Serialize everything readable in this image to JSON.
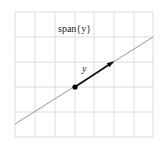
{
  "diagram": {
    "span_label": "span{y}",
    "vector_label": "y",
    "grid": {
      "x_lines": [
        15,
        35,
        55,
        75,
        94,
        114,
        134,
        153
      ],
      "y_lines": [
        12,
        37,
        62,
        87,
        112,
        137
      ],
      "color": "#dcdcdc"
    },
    "span_line": {
      "x1": 15,
      "y1": 124,
      "x2": 153,
      "y2": 37,
      "color": "#8a8a8a"
    },
    "origin": {
      "x": 75,
      "y": 87
    },
    "vector": {
      "x1": 75,
      "y1": 87,
      "x2": 113,
      "y2": 62,
      "color": "#111111"
    }
  }
}
